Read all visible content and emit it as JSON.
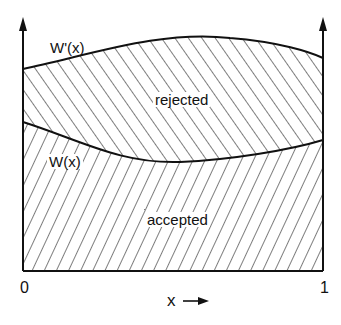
{
  "labels": {
    "upper_curve": "W'(x)",
    "lower_curve": "W(x)",
    "upper_region": "rejected",
    "lower_region": "accepted",
    "x_origin": "0",
    "x_end": "1",
    "x_axis": "x",
    "x_arrow": "→"
  },
  "colors": {
    "ink": "#111111",
    "background": "#ffffff"
  }
}
